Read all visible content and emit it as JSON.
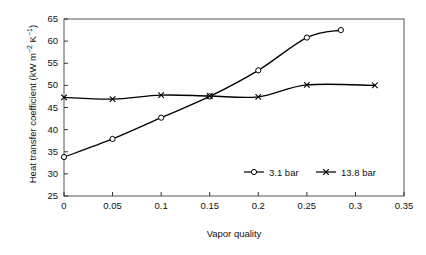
{
  "chart_data": {
    "type": "line",
    "title": "",
    "xlabel": "Vapor quality",
    "ylabel": "Heat transfer coefficient (kW m−2 K−1)",
    "ylabel_parts": {
      "main": "Heat transfer coefficient (kW m",
      "exp1": "−2",
      "mid": " K",
      "exp2": "−1",
      "tail": ")"
    },
    "xlim": [
      0,
      0.35
    ],
    "ylim": [
      25,
      65
    ],
    "xticks": [
      "0",
      "0.05",
      "0.1",
      "0.15",
      "0.2",
      "0.25",
      "0.3",
      "0.35"
    ],
    "xtick_values": [
      0,
      0.05,
      0.1,
      0.15,
      0.2,
      0.25,
      0.3,
      0.35
    ],
    "yticks": [
      "25",
      "30",
      "35",
      "40",
      "45",
      "50",
      "55",
      "60",
      "65"
    ],
    "ytick_values": [
      25,
      30,
      35,
      40,
      45,
      50,
      55,
      60,
      65
    ],
    "grid": false,
    "legend_position": "lower right",
    "series": [
      {
        "name": "3.1 bar",
        "marker": "circle",
        "color": "#000000",
        "x": [
          0,
          0.05,
          0.1,
          0.15,
          0.2,
          0.25,
          0.285
        ],
        "values": [
          33.8,
          37.9,
          42.7,
          47.5,
          53.4,
          60.8,
          62.5
        ]
      },
      {
        "name": "13.8 bar",
        "marker": "x",
        "color": "#000000",
        "x": [
          0,
          0.05,
          0.1,
          0.15,
          0.2,
          0.25,
          0.32
        ],
        "values": [
          47.3,
          46.9,
          47.8,
          47.6,
          47.4,
          50.1,
          50.0
        ]
      }
    ],
    "legend": [
      {
        "label": "3.1 bar",
        "marker": "circle"
      },
      {
        "label": "13.8 bar",
        "marker": "x"
      }
    ]
  }
}
